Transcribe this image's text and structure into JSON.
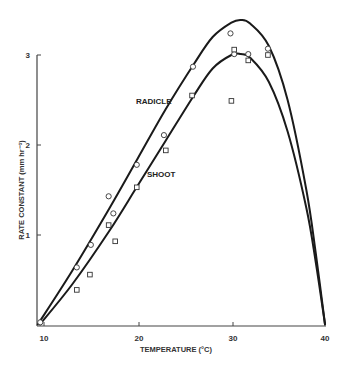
{
  "chart_data": {
    "type": "scatter",
    "title": "",
    "xlabel": "TEMPERATURE (°C)",
    "ylabel": "RATE CONSTANT (mm hr⁻¹)",
    "xlim": [
      9.3,
      40
    ],
    "ylim": [
      0,
      3.4
    ],
    "x_ticks": [
      10,
      20,
      30,
      40
    ],
    "y_ticks": [
      1,
      2,
      3
    ],
    "grid": false,
    "legend": "inline labels",
    "series": [
      {
        "name": "RADICLE",
        "marker": "circle",
        "points": [
          [
            9.6,
            0.03
          ],
          [
            13.5,
            0.64
          ],
          [
            15.0,
            0.89
          ],
          [
            16.9,
            1.43
          ],
          [
            17.4,
            1.24
          ],
          [
            19.9,
            1.78
          ],
          [
            22.8,
            2.11
          ],
          [
            25.9,
            2.87
          ],
          [
            29.9,
            3.24
          ],
          [
            30.3,
            3.01
          ],
          [
            31.8,
            3.01
          ],
          [
            33.9,
            3.07
          ]
        ],
        "fit_curve": [
          [
            9.3,
            0
          ],
          [
            13,
            0.6
          ],
          [
            17,
            1.3
          ],
          [
            20,
            1.85
          ],
          [
            23,
            2.4
          ],
          [
            26,
            2.9
          ],
          [
            28,
            3.2
          ],
          [
            30,
            3.36
          ],
          [
            31,
            3.39
          ],
          [
            32,
            3.35
          ],
          [
            34,
            3.1
          ],
          [
            36,
            2.5
          ],
          [
            38,
            1.5
          ],
          [
            39,
            0.8
          ],
          [
            40,
            0
          ]
        ]
      },
      {
        "name": "SHOOT",
        "marker": "square",
        "points": [
          [
            13.5,
            0.39
          ],
          [
            14.9,
            0.56
          ],
          [
            16.9,
            1.11
          ],
          [
            17.6,
            0.93
          ],
          [
            19.9,
            1.53
          ],
          [
            23.0,
            1.94
          ],
          [
            25.8,
            2.55
          ],
          [
            30.0,
            2.49
          ],
          [
            30.3,
            3.06
          ],
          [
            31.8,
            2.94
          ],
          [
            33.9,
            3.0
          ]
        ],
        "fit_curve": [
          [
            9.5,
            0
          ],
          [
            13,
            0.45
          ],
          [
            17,
            1.05
          ],
          [
            20,
            1.55
          ],
          [
            23,
            2.05
          ],
          [
            26,
            2.55
          ],
          [
            28,
            2.85
          ],
          [
            30,
            3.0
          ],
          [
            31,
            3.01
          ],
          [
            32,
            2.97
          ],
          [
            34,
            2.7
          ],
          [
            36,
            2.15
          ],
          [
            38,
            1.3
          ],
          [
            39,
            0.7
          ],
          [
            40,
            0
          ]
        ]
      }
    ]
  },
  "labels": {
    "radicle": "RADICLE",
    "shoot": "SHOOT",
    "xlabel": "TEMPERATURE (°C)",
    "ylabel": "RATE CONSTANT (mm hr⁻¹)",
    "x_ticks": [
      "10",
      "20",
      "30",
      "40"
    ],
    "y_ticks": [
      "1",
      "2",
      "3"
    ]
  }
}
